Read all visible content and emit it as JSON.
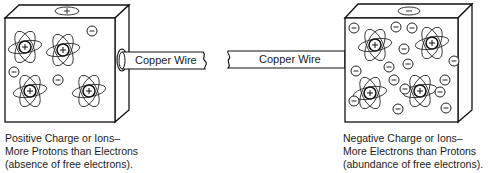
{
  "diagram": {
    "left_block": {
      "charge": "positive",
      "top_symbol": "+",
      "caption": [
        "Positive Charge or Ions–",
        "More Protons than Electrons",
        "(absence of free electrons)."
      ],
      "atoms": [
        {
          "x": 25,
          "y": 47
        },
        {
          "x": 63,
          "y": 50
        },
        {
          "x": 30,
          "y": 91
        },
        {
          "x": 89,
          "y": 91
        }
      ],
      "free_electrons": [
        {
          "x": 92,
          "y": 31
        },
        {
          "x": 14,
          "y": 72
        },
        {
          "x": 58,
          "y": 80
        }
      ]
    },
    "wire": {
      "left_label": "Copper Wire",
      "right_label": "Copper Wire",
      "color": "#ffffff"
    },
    "right_block": {
      "charge": "negative",
      "top_symbol": "−",
      "caption": [
        "Negative Charge or Ions–",
        "More Electrons than Protons",
        "(abundance of free electrons)."
      ],
      "atoms": [
        {
          "x": 375,
          "y": 45
        },
        {
          "x": 432,
          "y": 43
        },
        {
          "x": 370,
          "y": 93
        },
        {
          "x": 420,
          "y": 91
        }
      ],
      "free_electrons": [
        {
          "x": 354,
          "y": 28
        },
        {
          "x": 396,
          "y": 27
        },
        {
          "x": 412,
          "y": 28
        },
        {
          "x": 405,
          "y": 49
        },
        {
          "x": 455,
          "y": 60
        },
        {
          "x": 357,
          "y": 71
        },
        {
          "x": 390,
          "y": 66
        },
        {
          "x": 409,
          "y": 64
        },
        {
          "x": 394,
          "y": 79
        },
        {
          "x": 445,
          "y": 80
        },
        {
          "x": 354,
          "y": 101
        },
        {
          "x": 398,
          "y": 108
        },
        {
          "x": 446,
          "y": 108
        },
        {
          "x": 406,
          "y": 89
        },
        {
          "x": 440,
          "y": 20
        }
      ]
    }
  }
}
